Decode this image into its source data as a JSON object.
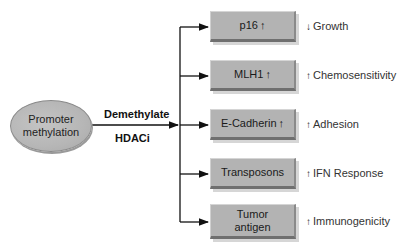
{
  "source": {
    "label_line1": "Promoter",
    "label_line2": "methylation"
  },
  "action": {
    "top_label": "Demethylate",
    "bottom_label": "HDACi"
  },
  "targets": [
    {
      "label": "p16",
      "arrow": "↑",
      "effect_arrow": "↓",
      "effect": "Growth"
    },
    {
      "label": "MLH1",
      "arrow": "↑",
      "effect_arrow": "↑",
      "effect": "Chemosensitivity"
    },
    {
      "label": "E-Cadherin",
      "arrow": "↑",
      "effect_arrow": "↑",
      "effect": "Adhesion"
    },
    {
      "label": "Transposons",
      "arrow": "",
      "effect_arrow": "↑",
      "effect": "IFN Response"
    },
    {
      "label": "Tumor antigen",
      "arrow": "",
      "effect_arrow": "↑",
      "effect": "Immunogenicity"
    }
  ],
  "colors": {
    "box_fill": "#b3b3b3",
    "ellipse_fill": "#b6b6b6",
    "line": "#111111"
  }
}
